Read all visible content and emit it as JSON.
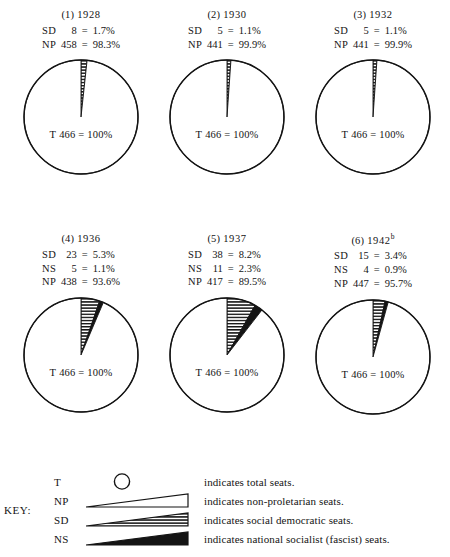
{
  "chart_data": {
    "type": "pie",
    "title": "",
    "total_label": "T",
    "total_seats": 466,
    "total_text": "T 466 = 100%",
    "series_order": [
      "SD",
      "NS",
      "NP"
    ],
    "legend_position": "bottom",
    "charts": [
      {
        "index": "(1)",
        "year": "1928",
        "superscript": "",
        "total": {
          "abbr": "T",
          "seats": "466",
          "eq": "=",
          "pct": "100%"
        },
        "slices": [
          {
            "abbr": "SD",
            "seats": "8",
            "eq": "=",
            "pct": "1.7%",
            "value": 1.7,
            "fill": "hatch"
          },
          {
            "abbr": "NP",
            "seats": "458",
            "eq": "=",
            "pct": "98.3%",
            "value": 98.3,
            "fill": "white"
          }
        ]
      },
      {
        "index": "(2)",
        "year": "1930",
        "superscript": "",
        "total": {
          "abbr": "T",
          "seats": "466",
          "eq": "=",
          "pct": "100%"
        },
        "slices": [
          {
            "abbr": "SD",
            "seats": "5",
            "eq": "=",
            "pct": "1.1%",
            "value": 1.1,
            "fill": "hatch"
          },
          {
            "abbr": "NP",
            "seats": "441",
            "eq": "=",
            "pct": "99.9%",
            "value": 98.9,
            "fill": "white"
          }
        ]
      },
      {
        "index": "(3)",
        "year": "1932",
        "superscript": "",
        "total": {
          "abbr": "T",
          "seats": "466",
          "eq": "=",
          "pct": "100%"
        },
        "slices": [
          {
            "abbr": "SD",
            "seats": "5",
            "eq": "=",
            "pct": "1.1%",
            "value": 1.1,
            "fill": "hatch"
          },
          {
            "abbr": "NP",
            "seats": "441",
            "eq": "=",
            "pct": "99.9%",
            "value": 98.9,
            "fill": "white"
          }
        ]
      },
      {
        "index": "(4)",
        "year": "1936",
        "superscript": "",
        "total": {
          "abbr": "T",
          "seats": "466",
          "eq": "=",
          "pct": "100%"
        },
        "slices": [
          {
            "abbr": "SD",
            "seats": "23",
            "eq": "=",
            "pct": "5.3%",
            "value": 5.3,
            "fill": "hatch"
          },
          {
            "abbr": "NS",
            "seats": "5",
            "eq": "=",
            "pct": "1.1%",
            "value": 1.1,
            "fill": "black"
          },
          {
            "abbr": "NP",
            "seats": "438",
            "eq": "=",
            "pct": "93.6%",
            "value": 93.6,
            "fill": "white"
          }
        ]
      },
      {
        "index": "(5)",
        "year": "1937",
        "superscript": "",
        "total": {
          "abbr": "T",
          "seats": "466",
          "eq": "=",
          "pct": "100%"
        },
        "slices": [
          {
            "abbr": "SD",
            "seats": "38",
            "eq": "=",
            "pct": "8.2%",
            "value": 8.2,
            "fill": "hatch"
          },
          {
            "abbr": "NS",
            "seats": "11",
            "eq": "=",
            "pct": "2.3%",
            "value": 2.3,
            "fill": "black"
          },
          {
            "abbr": "NP",
            "seats": "417",
            "eq": "=",
            "pct": "89.5%",
            "value": 89.5,
            "fill": "white"
          }
        ]
      },
      {
        "index": "(6)",
        "year": "1942",
        "superscript": "b",
        "total": {
          "abbr": "T",
          "seats": "466",
          "eq": "=",
          "pct": "100%"
        },
        "slices": [
          {
            "abbr": "SD",
            "seats": "15",
            "eq": "=",
            "pct": "3.4%",
            "value": 3.4,
            "fill": "hatch"
          },
          {
            "abbr": "NS",
            "seats": "4",
            "eq": "=",
            "pct": "0.9%",
            "value": 0.9,
            "fill": "black"
          },
          {
            "abbr": "NP",
            "seats": "447",
            "eq": "=",
            "pct": "95.7%",
            "value": 95.7,
            "fill": "white"
          }
        ]
      }
    ],
    "legend": {
      "label": "KEY:",
      "entries": [
        {
          "abbr": "T",
          "desc": "indicates total seats.",
          "swatch": "circle"
        },
        {
          "abbr": "NP",
          "desc": "indicates non-proletarian seats.",
          "swatch": "white"
        },
        {
          "abbr": "SD",
          "desc": "indicates social democratic seats.",
          "swatch": "hatch"
        },
        {
          "abbr": "NS",
          "desc": "indicates national socialist (fascist) seats.",
          "swatch": "black"
        }
      ]
    },
    "colors": {
      "ink": "#141414",
      "paper": "#ffffff"
    }
  }
}
